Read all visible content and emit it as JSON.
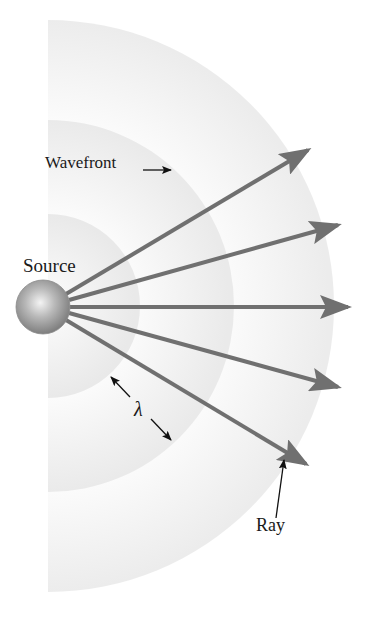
{
  "figure": {
    "labels": {
      "source": "Source",
      "wavefront": "Wavefront",
      "ray": "Ray",
      "wavelength": "λ"
    },
    "source": {
      "cx": 43,
      "cy": 306,
      "r": 27
    },
    "wavefronts": [
      {
        "name": "inner",
        "radius": 92
      },
      {
        "name": "middle",
        "radius": 186
      },
      {
        "name": "outer",
        "radius": 286
      }
    ],
    "rays": [
      {
        "tip_x": 311,
        "tip_y": 148
      },
      {
        "tip_x": 341,
        "tip_y": 224
      },
      {
        "tip_x": 352,
        "tip_y": 307
      },
      {
        "tip_x": 341,
        "tip_y": 388
      },
      {
        "tip_x": 309,
        "tip_y": 466
      }
    ],
    "colors": {
      "ray": "#707070",
      "band_dark": "#ebebeb",
      "band_light": "#fafafa",
      "annotation": "#111111"
    }
  }
}
